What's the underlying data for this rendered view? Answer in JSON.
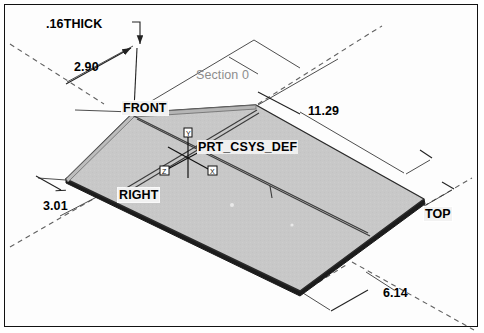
{
  "drawing": {
    "background_color": "#ffffff",
    "frame_color": "#111111",
    "part_fill_color": "#c8c8c8",
    "part_edge_color": "#1a1a1a",
    "datum_line_color": "#555555",
    "dimension_line_color": "#222222",
    "section_text_color": "#8d8d8d"
  },
  "dimensions": [
    {
      "id": "thickness",
      "value": ".16THICK",
      "x": 46,
      "y": 17
    },
    {
      "id": "height",
      "value": "2.90",
      "x": 74,
      "y": 60
    },
    {
      "id": "length",
      "value": "11.29",
      "x": 308,
      "y": 104
    },
    {
      "id": "offset",
      "value": "3.01",
      "x": 43,
      "y": 199
    },
    {
      "id": "width",
      "value": "6.14",
      "x": 383,
      "y": 286
    }
  ],
  "datum_labels": [
    {
      "id": "front",
      "value": "FRONT",
      "x": 122,
      "y": 101
    },
    {
      "id": "right",
      "value": "RIGHT",
      "x": 118,
      "y": 188
    },
    {
      "id": "top",
      "value": "TOP",
      "x": 424,
      "y": 207
    }
  ],
  "csys": {
    "label": "PRT_CSYS_DEF",
    "x": 197,
    "y": 140,
    "origin_x": 188,
    "origin_y": 158,
    "axis_labels": [
      "X",
      "Y",
      "Z"
    ]
  },
  "section": {
    "label": "Section 0",
    "x": 196,
    "y": 68
  }
}
